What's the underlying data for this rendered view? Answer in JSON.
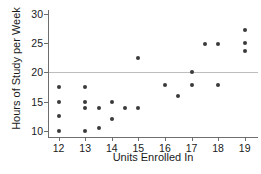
{
  "chart_data": {
    "type": "scatter",
    "title": "",
    "xlabel": "Units Enrolled In",
    "ylabel": "Hours of Study per Week",
    "xlim": [
      11.6,
      19.5
    ],
    "ylim": [
      9.0,
      30.6
    ],
    "xticks": [
      12,
      13,
      14,
      15,
      16,
      17,
      18,
      19
    ],
    "yticks": [
      10,
      15,
      20,
      25,
      30
    ],
    "grid": false,
    "legend": null,
    "reference_lines": [
      {
        "axis": "y",
        "value": 20,
        "color": "#bdbdbd"
      }
    ],
    "marker_color": "#3a3a3a",
    "points": [
      {
        "x": 12,
        "y": 17.5
      },
      {
        "x": 12,
        "y": 15.0
      },
      {
        "x": 12,
        "y": 12.5
      },
      {
        "x": 12,
        "y": 10.0
      },
      {
        "x": 13,
        "y": 17.5
      },
      {
        "x": 13,
        "y": 15.0
      },
      {
        "x": 13,
        "y": 14.0
      },
      {
        "x": 13,
        "y": 10.0
      },
      {
        "x": 13.5,
        "y": 14.0
      },
      {
        "x": 13.5,
        "y": 10.5
      },
      {
        "x": 14,
        "y": 15.0
      },
      {
        "x": 14,
        "y": 12.0
      },
      {
        "x": 14.5,
        "y": 14.0
      },
      {
        "x": 15,
        "y": 22.4
      },
      {
        "x": 15,
        "y": 14.0
      },
      {
        "x": 16,
        "y": 17.9
      },
      {
        "x": 16.5,
        "y": 16.0
      },
      {
        "x": 17,
        "y": 20.0
      },
      {
        "x": 17,
        "y": 17.9
      },
      {
        "x": 17.5,
        "y": 24.8
      },
      {
        "x": 18,
        "y": 24.8
      },
      {
        "x": 18,
        "y": 17.9
      },
      {
        "x": 19,
        "y": 27.2
      },
      {
        "x": 19,
        "y": 25.0
      },
      {
        "x": 19,
        "y": 23.7
      }
    ]
  }
}
